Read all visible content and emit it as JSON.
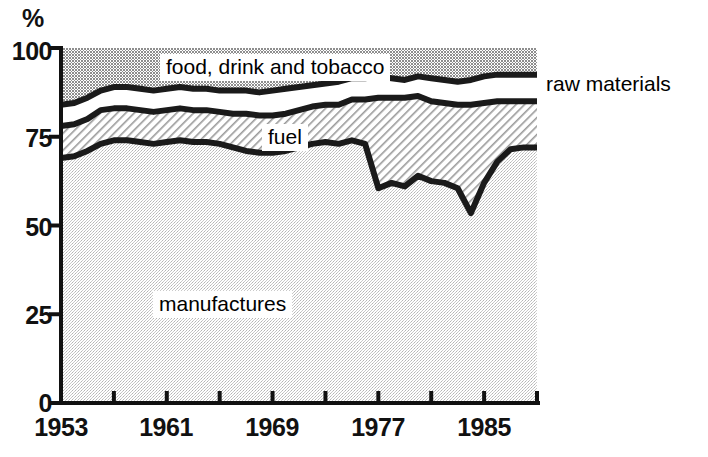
{
  "chart_data": {
    "type": "area",
    "title": "",
    "subtitle": "",
    "xlabel": "",
    "ylabel": "%",
    "ylim": [
      0,
      100
    ],
    "xlim": [
      1953,
      1989
    ],
    "grid": false,
    "legend_position": "inline-labels",
    "stacked": true,
    "yticks": [
      "0",
      "25",
      "50",
      "75",
      "100"
    ],
    "ytick_values": [
      0,
      25,
      50,
      75,
      100
    ],
    "xticks": [
      "1953",
      "1961",
      "1969",
      "1977",
      "1985"
    ],
    "xtick_values": [
      1953,
      1961,
      1969,
      1977,
      1985
    ],
    "xtick_minor_values": [
      1957,
      1965,
      1973,
      1981,
      1989
    ],
    "x": [
      1953,
      1954,
      1955,
      1956,
      1957,
      1958,
      1959,
      1960,
      1961,
      1962,
      1963,
      1964,
      1965,
      1966,
      1967,
      1968,
      1969,
      1970,
      1971,
      1972,
      1973,
      1974,
      1975,
      1976,
      1977,
      1978,
      1979,
      1980,
      1981,
      1982,
      1983,
      1984,
      1985,
      1986,
      1987,
      1988,
      1989
    ],
    "series": [
      {
        "name": "manufactures",
        "fill": "light-gray-dotted",
        "cumulative_top": [
          69,
          69.5,
          71,
          73,
          74,
          74,
          73.5,
          73,
          73.5,
          74,
          73.5,
          73.5,
          73,
          72,
          71,
          70.5,
          70.5,
          71,
          72,
          73,
          73.5,
          73,
          74,
          73,
          60.5,
          62,
          61,
          64,
          62.5,
          62,
          60.5,
          53.5,
          62,
          68,
          71.5,
          72,
          72
        ]
      },
      {
        "name": "fuel",
        "fill": "diagonal-hatch",
        "cumulative_top": [
          78,
          78.5,
          80,
          82.5,
          83,
          83,
          82.5,
          82,
          82.5,
          83,
          82.5,
          82.5,
          82,
          81.5,
          81.5,
          81,
          81,
          81.5,
          82.5,
          83.5,
          84,
          84,
          85.5,
          85.5,
          86,
          86,
          86,
          86.5,
          85,
          84.5,
          84,
          84,
          84.5,
          85,
          85,
          85,
          85
        ]
      },
      {
        "name": "food, drink and tobacco",
        "fill": "white",
        "cumulative_top": [
          84,
          84.5,
          86,
          88,
          89,
          89,
          88.5,
          88,
          88.5,
          89,
          88.5,
          88.5,
          88,
          88,
          88,
          87.5,
          88,
          88.5,
          89,
          89.5,
          90,
          90.5,
          91.5,
          91.5,
          92,
          91.5,
          91,
          92,
          91.5,
          91,
          90.5,
          91,
          92,
          92.5,
          92.5,
          92.5,
          92.5
        ]
      },
      {
        "name": "raw materials",
        "fill": "dark-gray-dotted",
        "cumulative_top": [
          100,
          100,
          100,
          100,
          100,
          100,
          100,
          100,
          100,
          100,
          100,
          100,
          100,
          100,
          100,
          100,
          100,
          100,
          100,
          100,
          100,
          100,
          100,
          100,
          100,
          100,
          100,
          100,
          100,
          100,
          100,
          100,
          100,
          100,
          100,
          100,
          100
        ]
      }
    ],
    "annotations": [
      {
        "text": "food, drink and tobacco",
        "placement": "inside-top-band-boxed"
      },
      {
        "text": "fuel",
        "placement": "inside-hatched-band-boxed"
      },
      {
        "text": "manufactures",
        "placement": "inside-bottom-band-boxed"
      },
      {
        "text": "raw materials",
        "placement": "right-of-plot"
      }
    ]
  },
  "axes": {
    "y_unit": "%",
    "y_ticks": [
      {
        "label": "100",
        "value": 100
      },
      {
        "label": "75",
        "value": 75
      },
      {
        "label": "50",
        "value": 50
      },
      {
        "label": "25",
        "value": 25
      },
      {
        "label": "0",
        "value": 0
      }
    ],
    "x_ticks": [
      {
        "label": "1953",
        "value": 1953
      },
      {
        "label": "1961",
        "value": 1961
      },
      {
        "label": "1969",
        "value": 1969
      },
      {
        "label": "1977",
        "value": 1977
      },
      {
        "label": "1985",
        "value": 1985
      }
    ]
  },
  "labels": {
    "food_drink_tobacco": "food, drink and tobacco",
    "fuel": "fuel",
    "manufactures": "manufactures",
    "raw_materials": "raw materials"
  },
  "colors": {
    "line": "#1a1a1a",
    "raw_materials_fill": "#a8a8a8",
    "food_drink_fill": "#ffffff",
    "fuel_fill": "#ffffff",
    "fuel_hatch": "#9a9a9a",
    "manufactures_fill": "#d8d8d8",
    "text": "#111111",
    "background": "#ffffff"
  }
}
